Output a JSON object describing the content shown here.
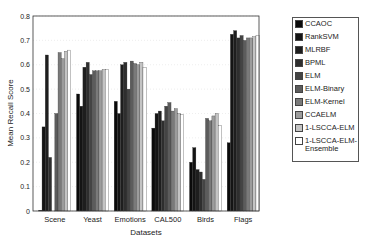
{
  "chart_data": {
    "type": "bar",
    "title": "",
    "xlabel": "Datasets",
    "ylabel": "Mean Recall Score",
    "ylim": [
      0,
      0.8
    ],
    "yticks": [
      "0",
      "0.1",
      "0.2",
      "0.3",
      "0.4",
      "0.5",
      "0.6",
      "0.7",
      "0.8"
    ],
    "grid": true,
    "legend_position": "right-outside",
    "categories": [
      "Scene",
      "Yeast",
      "Emotions",
      "CAL500",
      "Birds",
      "Flags"
    ],
    "series": [
      {
        "name": "CCAOC",
        "color": "#0a0a0a",
        "values": [
          0.003,
          0.48,
          0.45,
          0.34,
          0.2,
          0.28
        ]
      },
      {
        "name": "RankSVM",
        "color": "#141414",
        "values": [
          0.345,
          0.43,
          0.4,
          0.4,
          0.26,
          0.725
        ]
      },
      {
        "name": "MLRBF",
        "color": "#1e1e1e",
        "values": [
          0.64,
          0.59,
          0.6,
          0.41,
          0.17,
          0.74
        ]
      },
      {
        "name": "BPML",
        "color": "#2e2e2e",
        "values": [
          0.22,
          0.61,
          0.61,
          0.37,
          0.16,
          0.71
        ]
      },
      {
        "name": "ELM",
        "color": "#444444",
        "values": [
          0.0,
          0.56,
          0.5,
          0.43,
          0.13,
          0.72
        ]
      },
      {
        "name": "ELM-Binary",
        "color": "#5c5c5c",
        "values": [
          0.4,
          0.575,
          0.615,
          0.445,
          0.38,
          0.7
        ]
      },
      {
        "name": "ELM-Kernel",
        "color": "#7a7a7a",
        "values": [
          0.65,
          0.575,
          0.605,
          0.41,
          0.37,
          0.71
        ]
      },
      {
        "name": "CCAELM",
        "color": "#9c9c9c",
        "values": [
          0.625,
          0.575,
          0.6,
          0.42,
          0.39,
          0.71
        ]
      },
      {
        "name": "1-LSCCA-ELM",
        "color": "#c4c4c4",
        "values": [
          0.655,
          0.58,
          0.61,
          0.4,
          0.4,
          0.715
        ]
      },
      {
        "name": "1-LSCCA-ELM-Ensemble",
        "color": "#ffffff",
        "values": [
          0.66,
          0.58,
          0.59,
          0.395,
          0.35,
          0.72
        ]
      }
    ]
  },
  "legend": {
    "items": [
      {
        "label": "CCAOC",
        "color": "#0a0a0a"
      },
      {
        "label": "RankSVM",
        "color": "#141414"
      },
      {
        "label": "MLRBF",
        "color": "#1e1e1e"
      },
      {
        "label": "BPML",
        "color": "#2e2e2e"
      },
      {
        "label": "ELM",
        "color": "#444444"
      },
      {
        "label": "ELM-Binary",
        "color": "#5c5c5c"
      },
      {
        "label": "ELM-Kernel",
        "color": "#7a7a7a"
      },
      {
        "label": "CCAELM",
        "color": "#9c9c9c"
      },
      {
        "label": "1-LSCCA-ELM",
        "color": "#c4c4c4"
      },
      {
        "label": "1-LSCCA-ELM-Ensemble",
        "line1": "1-LSCCA-ELM-",
        "line2": "Ensemble",
        "color": "#ffffff"
      }
    ]
  }
}
